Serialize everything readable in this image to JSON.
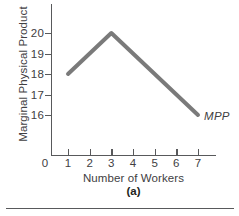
{
  "figure": {
    "caption": "(a)"
  },
  "chart_data": {
    "type": "line",
    "title": "",
    "subtitle": "",
    "xlabel": "Number of Workers",
    "ylabel": "Marginal Physical Product",
    "origin_label": "0",
    "x": [
      1,
      2,
      3,
      4,
      5,
      6,
      7
    ],
    "values": [
      18,
      19,
      20,
      19,
      18,
      17,
      16
    ],
    "series": [
      {
        "name": "MPP",
        "x": [
          1,
          3,
          7
        ],
        "values": [
          18,
          20,
          16
        ],
        "color": "#7a7a7a",
        "line_width": 4,
        "annotation": "MPP"
      }
    ],
    "xticks": [
      1,
      2,
      3,
      4,
      5,
      6,
      7
    ],
    "xtick_labels": [
      "1",
      "2",
      "3",
      "4",
      "5",
      "6",
      "7"
    ],
    "yticks": [
      16,
      17,
      18,
      19,
      20
    ],
    "ytick_labels": [
      "16",
      "17",
      "18",
      "19",
      "20"
    ],
    "xlim": [
      0,
      7.8
    ],
    "ylim": [
      15.1,
      20.4
    ],
    "grid": false,
    "legend": "none",
    "annotations": [
      {
        "text": "MPP",
        "x": 7,
        "y": 16,
        "style": "italic"
      }
    ]
  },
  "colors": {
    "series": "#7a7a7a",
    "axis": "#58595b",
    "text": "#414042",
    "caption": "#231f20",
    "background": "#ffffff"
  }
}
